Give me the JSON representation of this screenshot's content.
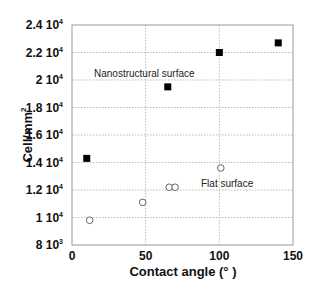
{
  "chart_data": {
    "type": "scatter",
    "title": "",
    "xlabel": "Contact angle (°  )",
    "ylabel": "Cell/mm²",
    "xlim": [
      0,
      150
    ],
    "ylim": [
      8000,
      24000
    ],
    "grid": true,
    "x_ticks": [
      "0",
      "50",
      "100",
      "150"
    ],
    "y_ticks": [
      {
        "mant": "8",
        "exp": "3",
        "value": 8000
      },
      {
        "mant": "1",
        "exp": "4",
        "value": 10000
      },
      {
        "mant": "1.2",
        "exp": "4",
        "value": 12000
      },
      {
        "mant": "1.4",
        "exp": "4",
        "value": 14000
      },
      {
        "mant": "1.6",
        "exp": "4",
        "value": 16000
      },
      {
        "mant": "1.8",
        "exp": "4",
        "value": 18000
      },
      {
        "mant": "2",
        "exp": "4",
        "value": 20000
      },
      {
        "mant": "2.2",
        "exp": "4",
        "value": 22000
      },
      {
        "mant": "2.4",
        "exp": "4",
        "value": 24000
      }
    ],
    "series": [
      {
        "name": "Nanostructural surface",
        "marker": "filled-square",
        "points": [
          [
            10,
            14300
          ],
          [
            65,
            19500
          ],
          [
            100,
            22000
          ],
          [
            140,
            22700
          ]
        ]
      },
      {
        "name": "Flat surface",
        "marker": "open-circle",
        "points": [
          [
            12,
            9800
          ],
          [
            48,
            11100
          ],
          [
            66,
            12200
          ],
          [
            70,
            12200
          ],
          [
            101,
            13600
          ]
        ]
      }
    ],
    "annotations": [
      {
        "text": "Nanostructural surface",
        "x": 22,
        "y": 20500
      },
      {
        "text": "Flat surface",
        "x": 88,
        "y": 14600
      }
    ]
  },
  "labels": {
    "xlabel": "Contact angle (°  )",
    "ylabel_main": "Cell/mm",
    "ylabel_sup": "2",
    "anno_nano": "Nanostructural surface",
    "anno_flat": "Flat surface"
  }
}
